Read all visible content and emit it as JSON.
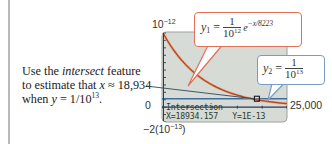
{
  "annotation": {
    "line1_pre": "Use the ",
    "line1_italic": "intersect",
    "line1_post": " feature",
    "line2_pre": "to estimate that ",
    "line2_var": "x",
    "line2_post": " ≈ 18,934",
    "line3_pre": "when ",
    "line3_var": "y",
    "line3_mid": " = 1/10",
    "line3_exp": "13",
    "line3_post": "."
  },
  "axes": {
    "ymax_base": "10",
    "ymax_exp": "−12",
    "xmin_label": "0",
    "xmax_label": "25,000",
    "ymin_pre": "−2(10",
    "ymin_exp": "−13",
    "ymin_post": ")"
  },
  "callout_y1": {
    "lhs": "y",
    "sub": "1",
    "equals": " = ",
    "num": "1",
    "den_base": "10",
    "den_exp": "12",
    "exp_base": "e",
    "exp_power": "−x/8223"
  },
  "callout_y2": {
    "lhs": "y",
    "sub": "2",
    "equals": " = ",
    "num": "1",
    "den_base": "10",
    "den_exp": "13"
  },
  "screen": {
    "mode_text": "Intersection",
    "result_text": "X=18934.157   Y=1E-13"
  },
  "colors": {
    "screen_bg": "#d6dbd5",
    "curve_y1": "#b84a2a",
    "curve_y1_glow": "#e8a070",
    "line_y2": "#3f6fa0",
    "axis": "#2a3a5a",
    "leader": "#2f4a5a",
    "callout1_border": "#e0705a",
    "callout2_border": "#7a9cc4"
  },
  "chart_data": {
    "type": "line",
    "title": "",
    "xlabel": "",
    "ylabel": "",
    "xlim": [
      0,
      25000
    ],
    "ylim": [
      -2e-13,
      1e-12
    ],
    "series": [
      {
        "name": "y1 = (1/10^12) e^(-x/8223)",
        "formula": "1e-12*exp(-x/8223)"
      },
      {
        "name": "y2 = 1/10^13",
        "formula": "1e-13"
      }
    ],
    "intersection": {
      "x": 18934.157,
      "y": 1e-13
    },
    "tick_labels": {
      "ymax": "10^-12",
      "ymin": "-2(10^-13)",
      "xmin": "0",
      "xmax": "25,000"
    }
  }
}
